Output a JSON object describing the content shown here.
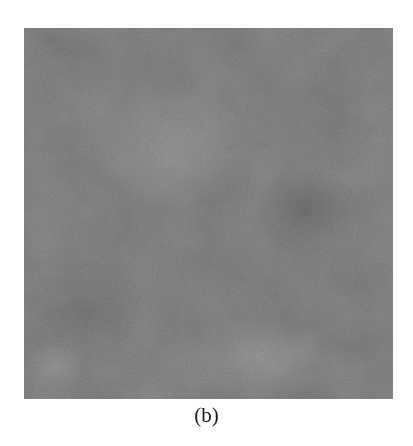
{
  "figure": {
    "caption": "(b)",
    "texture": {
      "description": "grayscale noisy texture patch",
      "base_color": "#7b7b7b",
      "dark_patch_color": "#5f5f5f",
      "light_patch_color": "#8c8c8c"
    }
  }
}
